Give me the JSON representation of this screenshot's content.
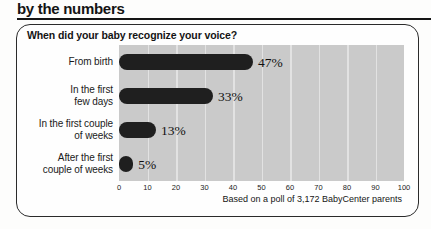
{
  "page_title": "by the numbers",
  "panel": {
    "heading": "When did your baby recognize your voice?",
    "footnote": "Based on a poll of 3,172 BabyCenter parents"
  },
  "chart_data": {
    "type": "bar",
    "orientation": "horizontal",
    "title": "When did your baby recognize your voice?",
    "categories": [
      "From birth",
      "In the first few days",
      "In the first couple of weeks",
      "After the first couple of weeks"
    ],
    "category_display_lines": [
      [
        "From birth"
      ],
      [
        "In the first",
        "few days"
      ],
      [
        "In the first couple",
        "of weeks"
      ],
      [
        "After the first",
        "couple of weeks"
      ]
    ],
    "values": [
      47,
      33,
      13,
      5
    ],
    "value_labels": [
      "47%",
      "33%",
      "13%",
      "5%"
    ],
    "xlim": [
      0,
      100
    ],
    "xticks": [
      0,
      10,
      20,
      30,
      40,
      50,
      60,
      70,
      80,
      90,
      100
    ],
    "grid": true,
    "legend": "none",
    "footnote": "Based on a poll of 3,172 BabyCenter parents",
    "colors": {
      "bar": "#1f1f1f",
      "plot_background": "#cacaca",
      "gridline": "#e2e2e2",
      "panel_border": "#2b2b2b",
      "text": "#141414"
    }
  }
}
